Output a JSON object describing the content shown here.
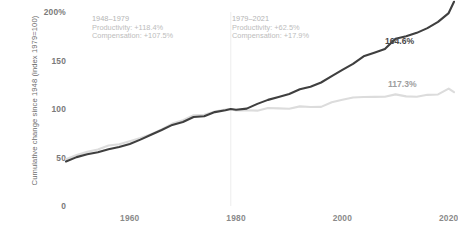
{
  "chart_data": {
    "type": "line",
    "title": "",
    "xlabel": "",
    "ylabel": "Cumulative change since 1948 (index 1979=100)",
    "xlim": [
      1948,
      2021
    ],
    "ylim": [
      0,
      200
    ],
    "grid": false,
    "legend_position": "inline-end-labels",
    "xticks": [
      1960,
      1980,
      2000,
      2020
    ],
    "xtick_labels": [
      "1960",
      "1980",
      "2000",
      "2020"
    ],
    "yticks": [
      0,
      50,
      100,
      150,
      200
    ],
    "ytick_labels": [
      "0",
      "50",
      "100",
      "150",
      "200%"
    ],
    "divider_x": 1979,
    "series": [
      {
        "name": "Productivity",
        "color": "#3f3f3f",
        "end_label": "164.6%",
        "x": [
          1948,
          1950,
          1952,
          1954,
          1956,
          1958,
          1960,
          1962,
          1964,
          1966,
          1968,
          1970,
          1972,
          1974,
          1976,
          1978,
          1979,
          1980,
          1982,
          1984,
          1986,
          1988,
          1990,
          1992,
          1994,
          1996,
          1998,
          2000,
          2002,
          2004,
          2006,
          2008,
          2010,
          2012,
          2014,
          2016,
          2018,
          2020,
          2021
        ],
        "values": [
          45.9,
          50.4,
          53.3,
          55.5,
          58.5,
          60.8,
          64.0,
          68.4,
          73.5,
          78.4,
          83.6,
          86.6,
          91.8,
          92.5,
          96.8,
          98.7,
          100.0,
          99.3,
          100.4,
          105.3,
          109.4,
          112.3,
          115.4,
          120.3,
          123.0,
          127.3,
          133.9,
          140.4,
          146.6,
          154.3,
          158.1,
          161.9,
          172.5,
          175.0,
          178.5,
          183.4,
          189.8,
          198.9,
          210.5
        ],
        "end_value": 164.6,
        "change_1948_1979_pct": 118.4,
        "change_1979_2021_pct": 62.5
      },
      {
        "name": "Compensation",
        "color": "#dcdcdc",
        "end_label": "117.3%",
        "x": [
          1948,
          1950,
          1952,
          1954,
          1956,
          1958,
          1960,
          1962,
          1964,
          1966,
          1968,
          1970,
          1972,
          1974,
          1976,
          1978,
          1979,
          1980,
          1982,
          1984,
          1986,
          1988,
          1990,
          1992,
          1994,
          1996,
          1998,
          2000,
          2002,
          2004,
          2006,
          2008,
          2010,
          2012,
          2014,
          2016,
          2018,
          2020,
          2021
        ],
        "values": [
          48.2,
          52.6,
          55.8,
          58.2,
          62.3,
          63.6,
          66.8,
          70.0,
          74.0,
          79.0,
          85.0,
          88.5,
          93.5,
          94.0,
          97.4,
          99.4,
          100.0,
          98.4,
          98.7,
          98.3,
          101.0,
          100.6,
          100.3,
          102.7,
          102.0,
          102.2,
          106.9,
          109.5,
          111.8,
          112.3,
          112.5,
          112.7,
          115.1,
          113.0,
          112.6,
          114.6,
          115.0,
          121.0,
          117.3
        ],
        "end_value": 117.3,
        "change_1948_1979_pct": 107.5,
        "change_1979_2021_pct": 17.9
      }
    ],
    "annotations": [
      {
        "id": "era1",
        "period": "1948–1979",
        "lines": [
          "Productivity: +118.4%",
          "Compensation: +107.5%"
        ]
      },
      {
        "id": "era2",
        "period": "1979–2021",
        "lines": [
          "Productivity: +62.5%",
          "Compensation: +17.9%"
        ]
      }
    ],
    "colors": {
      "productivity": "#3f3f3f",
      "compensation": "#dcdcdc",
      "divider": "#ededed",
      "tick_text": "#7a7a7a",
      "annotation_text": "#b9b9b9",
      "background": "#ffffff"
    }
  }
}
